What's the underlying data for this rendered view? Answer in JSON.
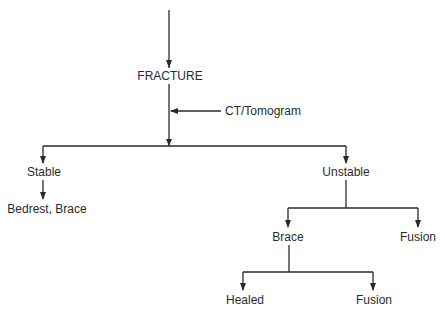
{
  "diagram": {
    "type": "flowchart",
    "colors": {
      "line": "#2a2a2a",
      "text": "#2a2a2a",
      "background": "#ffffff"
    },
    "nodes": {
      "fracture": "FRACTURE",
      "ct": "CT/Tomogram",
      "stable": "Stable",
      "bedrest": "Bedrest, Brace",
      "unstable": "Unstable",
      "brace": "Brace",
      "fusion_right": "Fusion",
      "healed": "Healed",
      "fusion_bottom": "Fusion"
    },
    "edges": [
      {
        "from": "start",
        "to": "FRACTURE"
      },
      {
        "from": "CT/Tomogram",
        "to": "FRACTURE-path"
      },
      {
        "from": "FRACTURE",
        "to": "Stable"
      },
      {
        "from": "FRACTURE",
        "to": "Unstable"
      },
      {
        "from": "Stable",
        "to": "Bedrest, Brace"
      },
      {
        "from": "Unstable",
        "to": "Brace"
      },
      {
        "from": "Unstable",
        "to": "Fusion"
      },
      {
        "from": "Brace",
        "to": "Healed"
      },
      {
        "from": "Brace",
        "to": "Fusion"
      }
    ]
  }
}
